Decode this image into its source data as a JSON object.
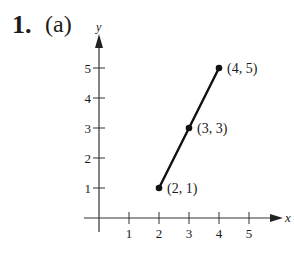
{
  "problem": {
    "number": "1.",
    "part": "(a)"
  },
  "chart_data": {
    "type": "line",
    "title": "",
    "xlabel": "x",
    "ylabel": "y",
    "xlim": [
      0,
      5.5
    ],
    "ylim": [
      0,
      5.5
    ],
    "xticks": [
      "1",
      "2",
      "3",
      "4",
      "5"
    ],
    "yticks": [
      "1",
      "2",
      "3",
      "4",
      "5"
    ],
    "grid": false,
    "series": [
      {
        "name": "segment",
        "x": [
          2,
          3,
          4
        ],
        "y": [
          1,
          3,
          5
        ]
      }
    ],
    "annotations": [
      {
        "x": 2,
        "y": 1,
        "label": "(2, 1)"
      },
      {
        "x": 3,
        "y": 3,
        "label": "(3, 3)"
      },
      {
        "x": 4,
        "y": 5,
        "label": "(4, 5)"
      }
    ]
  }
}
